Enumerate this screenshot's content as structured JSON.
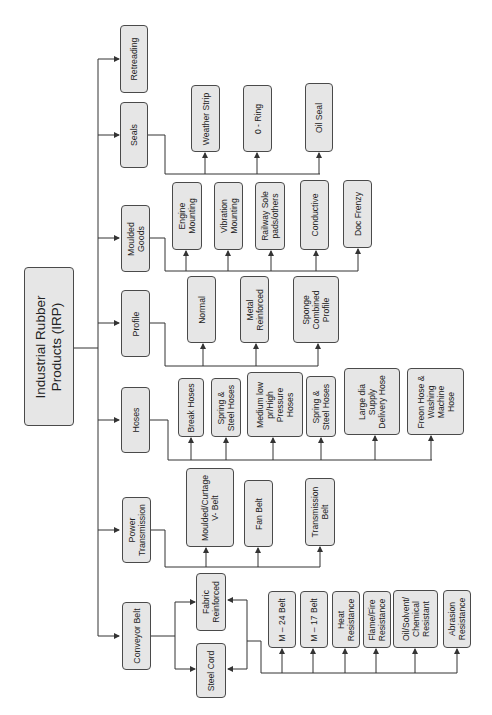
{
  "diagram": {
    "root": {
      "label": "Industrial Rubber\nProducts (IRP)"
    },
    "categories": [
      {
        "label": "Retreading",
        "children": []
      },
      {
        "label": "Seals",
        "children": [
          "Weather Strip",
          "0 - Ring",
          "Oil Seal"
        ]
      },
      {
        "label": "Moulded\nGoods",
        "children": [
          "Engine\nMounting",
          "Vibration\nMounting",
          "Railway Sole\npads/others",
          "Conductive",
          "Doc Frenzy"
        ]
      },
      {
        "label": "Profile",
        "children": [
          "Normal",
          "Metal\nReinforced",
          "Sponge\nCombined\nProfile"
        ]
      },
      {
        "label": "Hoses",
        "children": [
          "Break Hoses",
          "Spring &\nSteel Hoses",
          "Medium low\npr/High\nPressure\nHoses",
          "Spring &\nSteel Hoses",
          "Large dia\nSupply\nDelivery Hose",
          "Freon Hose &\nWashing\nMachine\nHose"
        ]
      },
      {
        "label": "Power\nTransmission",
        "children": [
          "Moulded/Curtage\nV- Belt",
          "Fan Belt",
          "Transmission\nBelt"
        ]
      },
      {
        "label": "Conveyor Belt",
        "children": [
          "Fabric\nReinforced",
          "Steel Cord"
        ]
      }
    ],
    "conveyor_types": [
      "M – 24 Belt",
      "M – 17 Belt",
      "Heat\nResistance",
      "Flame/Fire\nResistance",
      "Oil/Solvent/\nChemical\nResistant",
      "Abrasion\nResistance"
    ],
    "colors": {
      "box_fill": "#e6e6e6",
      "box_border": "#4a4a4a",
      "line": "#333333",
      "background": "#ffffff"
    }
  }
}
